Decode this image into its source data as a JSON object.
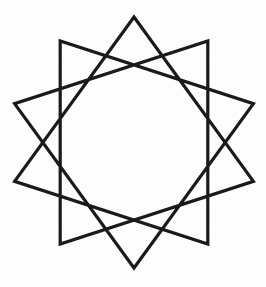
{
  "figure": {
    "title": "Ten-Pointed Star Polygon",
    "caption": "",
    "description": "A single continuous line drawing of a ten-pointed star polygon, Schlafli symbol {10/3}, with an empty decagonal region at the center.",
    "background_color": "#fdfdfd",
    "stroke_color": "#1a1a1a",
    "stroke_width": 3.2,
    "fill": "none",
    "canvas": {
      "width": 266,
      "height": 287
    }
  },
  "geometry": {
    "type": "star-polygon",
    "schlafli": "{10/3}",
    "points": 10,
    "step": 3,
    "center_x": 134,
    "center_y": 142.5,
    "outer_radius": 125.5,
    "start_angle_deg": -90,
    "rotation_deg": 0,
    "closed": true,
    "vertex_count": 10,
    "vertices": [
      {
        "index": 0,
        "label": "top",
        "angle_deg": -90,
        "x": 134.0,
        "y": 17.0
      },
      {
        "index": 1,
        "label": "upper-right",
        "angle_deg": -54,
        "x": 207.8,
        "y": 41.0
      },
      {
        "index": 2,
        "label": "right-upper",
        "angle_deg": -18,
        "x": 253.4,
        "y": 103.7
      },
      {
        "index": 3,
        "label": "right-lower",
        "angle_deg": 18,
        "x": 253.4,
        "y": 181.3
      },
      {
        "index": 4,
        "label": "lower-right",
        "angle_deg": 54,
        "x": 207.8,
        "y": 244.0
      },
      {
        "index": 5,
        "label": "bottom",
        "angle_deg": 90,
        "x": 134.0,
        "y": 268.0
      },
      {
        "index": 6,
        "label": "lower-left",
        "angle_deg": 126,
        "x": 60.2,
        "y": 244.0
      },
      {
        "index": 7,
        "label": "left-lower",
        "angle_deg": 162,
        "x": 14.6,
        "y": 181.3
      },
      {
        "index": 8,
        "label": "left-upper",
        "angle_deg": 198,
        "x": 14.6,
        "y": 103.7
      },
      {
        "index": 9,
        "label": "upper-left",
        "angle_deg": 234,
        "x": 60.2,
        "y": 41.0
      }
    ],
    "draw_order": [
      0,
      3,
      6,
      9,
      2,
      5,
      8,
      1,
      4,
      7
    ],
    "extents": {
      "left": 14.6,
      "right": 253.4,
      "top": 17.0,
      "bottom": 268.0
    }
  },
  "legend": {
    "visible": false,
    "entries": []
  },
  "annotations": []
}
